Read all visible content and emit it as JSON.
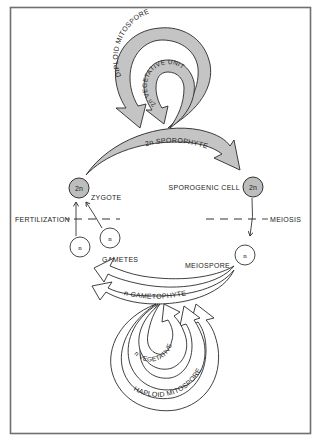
{
  "diagram": {
    "colors": {
      "diploid_fill": "#c4c4c4",
      "haploid_fill": "#ffffff",
      "stroke": "#2a2a2a",
      "frame": "#6f6f6f"
    },
    "arrows": {
      "diploid_mitospore": "DIPLOID MITOSPORE",
      "diploid_vegetative_unit": "2n VEGETATIVE UNIT",
      "sporophyte": "2n SPOROPHYTE",
      "gametophyte": "n GAMETOPHYTE",
      "haploid_vegetative_unit": "n VEGETATIVE UNIT",
      "haploid_mitospore": "HAPLOID MITOSPORE"
    },
    "cells": {
      "zygote": {
        "label": "ZYGOTE",
        "ploidy": "2n"
      },
      "sporogenic_cell": {
        "label": "SPOROGENIC CELL",
        "ploidy": "2n"
      },
      "meiospore": {
        "label": "MEIOSPORE",
        "ploidy": "n"
      },
      "gamete_1": {
        "ploidy": "n"
      },
      "gamete_2": {
        "ploidy": "n"
      },
      "gametes_label": "GAMETES"
    },
    "events": {
      "fertilization": "FERTILIZATION",
      "meiosis": "MEIOSIS"
    }
  }
}
